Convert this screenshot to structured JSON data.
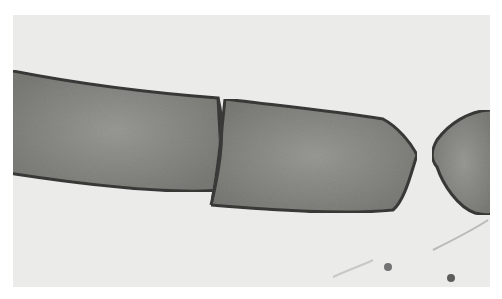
{
  "image": {
    "subject": "transmission electron micrograph of rod-shaped bacterial cells dividing",
    "colors": {
      "background": "#ebebe9",
      "cell_fill": "#8a8a86",
      "cell_wall": "#3a3a38",
      "speck": "#555555"
    }
  }
}
